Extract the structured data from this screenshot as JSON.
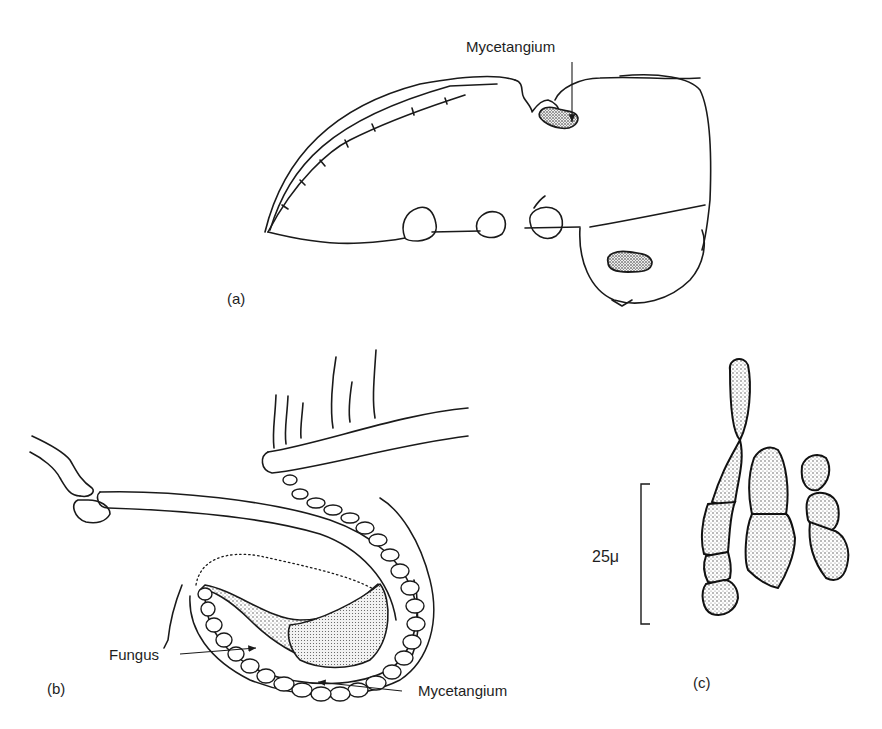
{
  "figure": {
    "panels": [
      {
        "id": "a",
        "label": "(a)",
        "description": "Lateral outline of beetle showing mycetangium location"
      },
      {
        "id": "b",
        "label": "(b)",
        "description": "Enlarged section of mycetangium with fungus"
      },
      {
        "id": "c",
        "label": "(c)",
        "description": "Fungal cells with scale bar"
      }
    ],
    "annotations": {
      "a_mycetangium": "Mycetangium",
      "b_fungus": "Fungus",
      "b_mycetangium": "Mycetangium",
      "c_scale": "25μ"
    },
    "colors": {
      "line": "#1a1a1a",
      "stipple": "#555555",
      "background": "#ffffff"
    }
  }
}
